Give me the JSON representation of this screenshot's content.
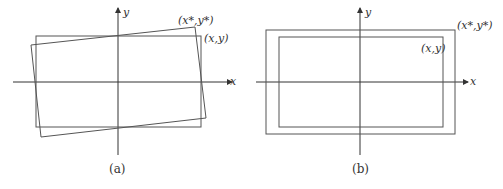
{
  "panels": [
    {
      "id": "a",
      "caption": "(a)",
      "x_axis_label": "x",
      "y_axis_label": "y",
      "outer_label": "(x*,y*)",
      "inner_label": "(x,y)",
      "description": "Original rectangle (x,y) and slightly rotated rectangle (x*,y*) around origin"
    },
    {
      "id": "b",
      "caption": "(b)",
      "x_axis_label": "x",
      "y_axis_label": "y",
      "outer_label": "(x*,y*)",
      "inner_label": "(x,y)",
      "description": "Original rectangle (x,y) and uniformly scaled larger rectangle (x*,y*) centered on origin"
    }
  ],
  "colors": {
    "stroke": "#555555",
    "axis": "#333333",
    "background": "#ffffff"
  }
}
